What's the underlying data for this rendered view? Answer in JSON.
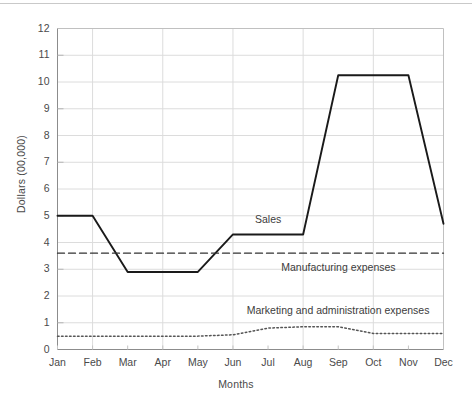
{
  "chart_data": {
    "type": "line",
    "title": "",
    "xlabel": "Months",
    "ylabel": "Dollars (00,000)",
    "categories": [
      "Jan",
      "Feb",
      "Mar",
      "Apr",
      "May",
      "Jun",
      "Jul",
      "Aug",
      "Sep",
      "Oct",
      "Nov",
      "Dec"
    ],
    "ylim": [
      0,
      12
    ],
    "yticks": [
      0,
      1,
      2,
      3,
      4,
      5,
      6,
      7,
      8,
      9,
      10,
      11,
      12
    ],
    "grid": true,
    "grid_x_months": [
      "Feb",
      "Apr",
      "Jun",
      "Aug",
      "Oct",
      "Dec"
    ],
    "legend_position": "inline-annotations",
    "series": [
      {
        "name": "Sales",
        "style": "solid",
        "color": "#1a1a1a",
        "values": [
          5.0,
          5.0,
          2.9,
          2.9,
          2.9,
          4.3,
          4.3,
          4.3,
          10.25,
          10.25,
          10.25,
          4.7
        ],
        "annotation": "Sales"
      },
      {
        "name": "Manufacturing expenses",
        "style": "dashed",
        "color": "#333333",
        "values": [
          3.6,
          3.6,
          3.6,
          3.6,
          3.6,
          3.6,
          3.6,
          3.6,
          3.6,
          3.6,
          3.6,
          3.6
        ],
        "annotation": "Manufacturing expenses"
      },
      {
        "name": "Marketing and administration expenses",
        "style": "dotted",
        "color": "#555555",
        "values": [
          0.5,
          0.5,
          0.5,
          0.5,
          0.5,
          0.55,
          0.8,
          0.85,
          0.85,
          0.6,
          0.6,
          0.6
        ],
        "annotation": "Marketing and administration expenses"
      }
    ],
    "annotations": [
      {
        "text": "Sales",
        "x_month": "Jul",
        "y_value": 4.85
      },
      {
        "text": "Manufacturing expenses",
        "x_month": "Sep",
        "y_value": 3.05
      },
      {
        "text": "Marketing and administration expenses",
        "x_month": "Sep",
        "y_value": 1.45
      }
    ]
  },
  "axes": {
    "y_ticks": [
      "0",
      "1",
      "2",
      "3",
      "4",
      "5",
      "6",
      "7",
      "8",
      "9",
      "10",
      "11",
      "12"
    ],
    "x_ticks": [
      "Jan",
      "Feb",
      "Mar",
      "Apr",
      "May",
      "Jun",
      "Jul",
      "Aug",
      "Sep",
      "Oct",
      "Nov",
      "Dec"
    ],
    "y_title": "Dollars (00,000)",
    "x_title": "Months"
  },
  "colors": {
    "sales_line": "#1a1a1a",
    "manufacturing_line": "#333333",
    "marketing_line": "#555555",
    "grid": "#dcdcdc",
    "frame": "#c0c0c0",
    "text": "#4a4a4a",
    "background": "#ffffff"
  }
}
